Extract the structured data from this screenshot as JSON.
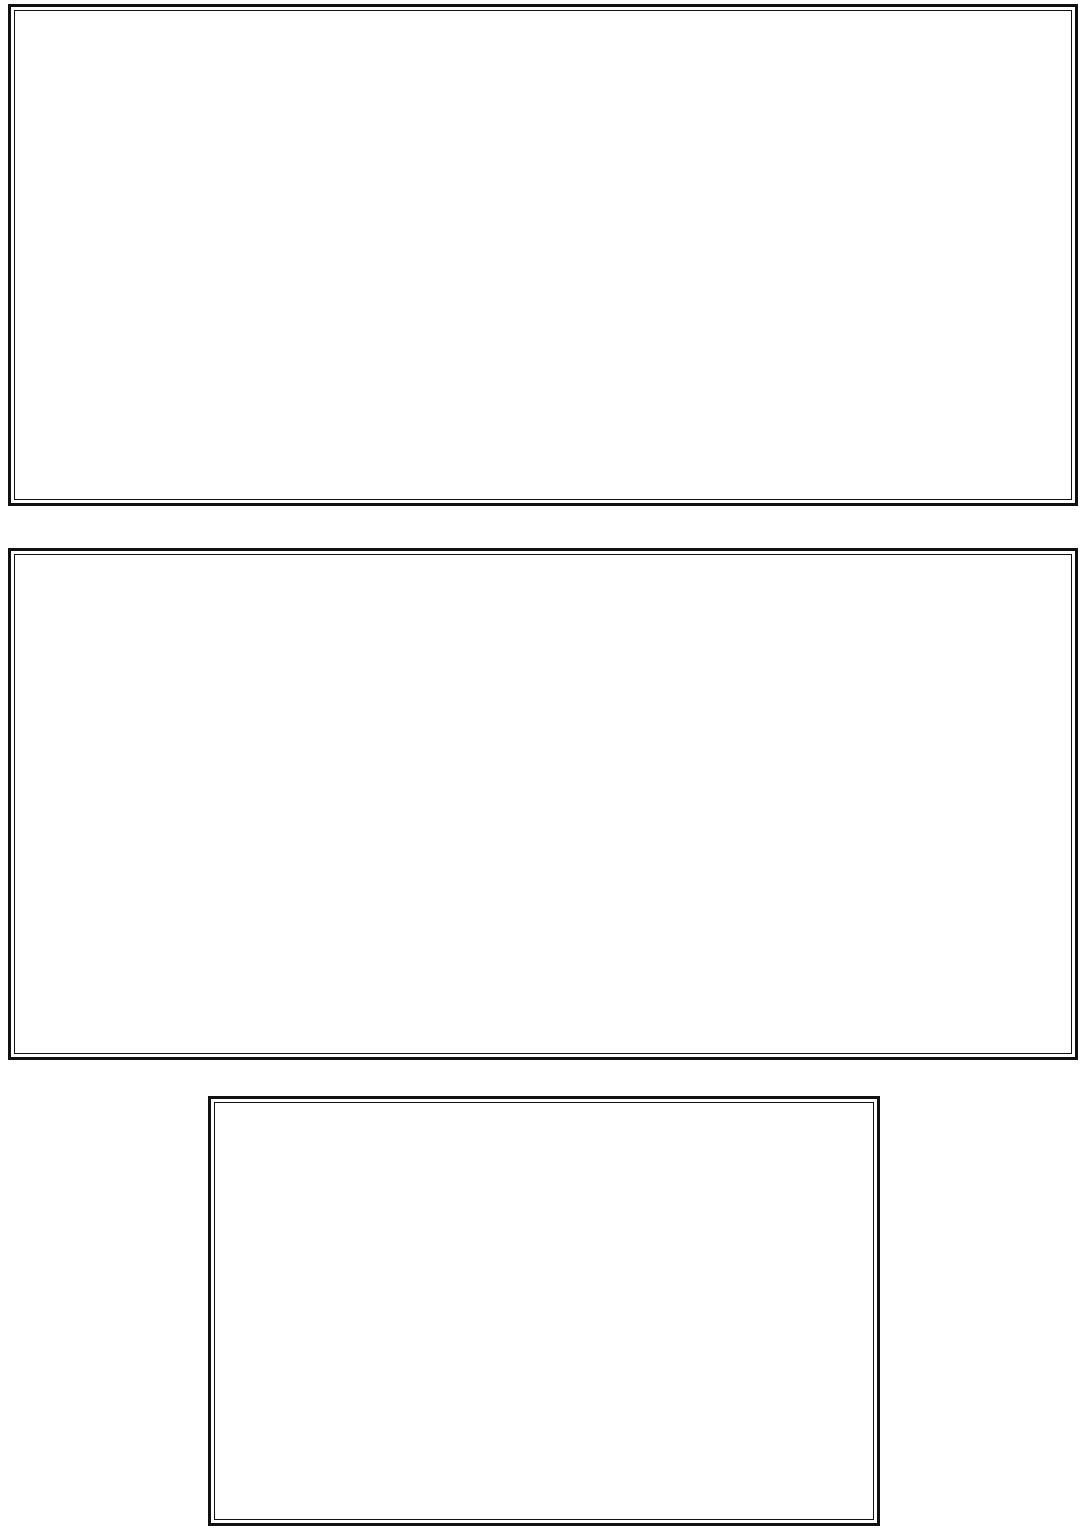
{
  "figure": {
    "series_names": [
      "OKABA",
      "ENUGU"
    ],
    "xlabel": "WEEKS",
    "colors": {
      "okaba_light": "#9db9e0",
      "okaba_light_edge": "#6f90c4",
      "enugu_light": "#f7b49c",
      "enugu_light_edge": "#e2764f",
      "okaba_dark": "#3e4b8f",
      "okaba_dark_edge": "#2c3770",
      "enugu_dark": "#8c4430",
      "enugu_dark_edge": "#6d3021",
      "axis": "#1a1a1a"
    }
  },
  "chart_data": [
    {
      "id": "volatile-matter",
      "type": "scatter",
      "title": "",
      "xlabel": "WEEKS",
      "ylabel": "VOLATILE MATTER  (%)",
      "xlim": [
        0,
        60
      ],
      "ylim": [
        35,
        45
      ],
      "xticks": [
        0,
        10,
        20,
        30,
        40,
        50,
        60
      ],
      "yticks": [
        35,
        37,
        39,
        41,
        43,
        45
      ],
      "xticklabels": [
        "0",
        "10",
        "20",
        "30",
        "40",
        "50",
        "60"
      ],
      "yticklabels": [
        "35",
        "37",
        "39",
        "41",
        "43",
        "45"
      ],
      "grid": true,
      "legend_position": "top-right",
      "palette": "light",
      "x": [
        0,
        1,
        4,
        10,
        19,
        32,
        52
      ],
      "series": [
        {
          "name": "OKABA",
          "marker": "diamond",
          "values": [
            43.0,
            40.7,
            39.0,
            37.5,
            36.3,
            35.4,
            35.15
          ]
        },
        {
          "name": "ENUGU",
          "marker": "square",
          "values": [
            44.0,
            43.0,
            42.5,
            41.9,
            41.6,
            41.4,
            41.0
          ]
        }
      ]
    },
    {
      "id": "oxygen",
      "type": "scatter",
      "title": "",
      "xlabel": "WEEKS",
      "ylabel": "OXYGEN (%)",
      "xlim": [
        0,
        60
      ],
      "ylim": [
        5,
        25
      ],
      "xticks": [
        0,
        10,
        20,
        30,
        40,
        50,
        60
      ],
      "yticks": [
        5,
        10,
        15,
        20,
        25
      ],
      "xticklabels": [
        "0",
        "10",
        "20",
        "30",
        "40",
        "50",
        "60"
      ],
      "yticklabels": [
        "5",
        "10",
        "15",
        "20",
        "25"
      ],
      "grid": true,
      "legend_position": "top-right",
      "palette": "dark",
      "x": [
        0,
        1,
        4,
        10,
        19,
        32,
        52
      ],
      "series": [
        {
          "name": "OKABA",
          "marker": "diamond",
          "values": [
            12.4,
            17.9,
            18.0,
            18.9,
            19.5,
            20.2,
            20.7
          ]
        },
        {
          "name": "ENUGU",
          "marker": "square",
          "values": [
            7.0,
            7.8,
            8.2,
            8.8,
            8.8,
            8.8,
            8.8
          ]
        }
      ]
    },
    {
      "id": "carbon",
      "type": "scatter",
      "title": "",
      "xlabel": "WEEKS",
      "ylabel": "CARBON (%)",
      "xlim": [
        0,
        60
      ],
      "ylim": [
        72,
        84
      ],
      "xticks": [
        0,
        10,
        20,
        30,
        40,
        50,
        60
      ],
      "yticks": [
        72,
        74,
        76,
        78,
        80,
        82,
        84
      ],
      "xticklabels": [
        "0",
        "10",
        "20",
        "30",
        "40",
        "50",
        "60"
      ],
      "yticklabels": [
        "72",
        "74",
        "76",
        "78",
        "80",
        "82",
        "84"
      ],
      "grid": true,
      "legend_position": "top-right",
      "palette": "dark",
      "x": [
        0,
        1,
        4,
        10,
        19,
        32,
        52
      ],
      "series": [
        {
          "name": "OKABA",
          "marker": "diamond",
          "values": [
            80.5,
            77.0,
            75.7,
            75.0,
            74.0,
            73.1,
            72.9
          ]
        },
        {
          "name": "ENUGU",
          "marker": "square",
          "values": [
            82.6,
            82.6,
            80.9,
            80.0,
            79.4,
            79.4,
            79.4
          ]
        }
      ]
    },
    {
      "id": "hydrogen",
      "type": "scatter",
      "title": "",
      "xlabel": "WEEKS",
      "ylabel": "HYDROGEN (%)",
      "xlim": [
        0,
        60
      ],
      "ylim": [
        5.3,
        6.0
      ],
      "xticks": [
        0,
        10,
        20,
        30,
        40,
        50,
        60
      ],
      "yticks": [
        5.3,
        5.4,
        5.5,
        5.6,
        5.7,
        5.8,
        5.9,
        6.0
      ],
      "xticklabels": [
        "0",
        "10",
        "20",
        "30",
        "40",
        "50",
        "60"
      ],
      "yticklabels": [
        "5.3",
        "5.4",
        "5.5",
        "5.6",
        "5.7",
        "5.8",
        "5.9",
        "6.0"
      ],
      "grid": true,
      "legend_position": "top-right",
      "palette": "dark",
      "x": [
        0,
        1,
        4,
        10,
        19,
        32,
        52
      ],
      "series": [
        {
          "name": "OKABA",
          "marker": "diamond",
          "values": [
            5.8,
            5.7,
            5.6,
            5.535,
            5.5,
            5.445,
            5.4
          ]
        },
        {
          "name": "ENUGU",
          "marker": "square",
          "values": [
            5.89,
            5.845,
            5.79,
            5.745,
            5.695,
            5.695,
            5.695
          ]
        }
      ]
    },
    {
      "id": "gross-calorific-value",
      "type": "scatter",
      "title": "",
      "xlabel": "WEEKS",
      "ylabel": "GROSS CALORIFIC VALUE  (MJ/kg)",
      "xlim": [
        0,
        60
      ],
      "ylim": [
        20,
        36
      ],
      "xticks": [
        0,
        10,
        20,
        30,
        40,
        50,
        60
      ],
      "yticks": [
        20,
        22,
        24,
        26,
        28,
        30,
        32,
        34,
        36
      ],
      "xticklabels": [
        "0",
        "10",
        "20",
        "30",
        "40",
        "50",
        "60"
      ],
      "yticklabels": [
        "20",
        "22",
        "24",
        "26",
        "28",
        "30",
        "32",
        "34",
        "36"
      ],
      "grid": true,
      "legend_position": "top-right",
      "palette": "dark",
      "x": [
        0,
        1,
        4,
        10,
        19,
        32,
        52
      ],
      "series": [
        {
          "name": "OKABA",
          "marker": "diamond",
          "values": [
            31.0,
            30.0,
            28.0,
            26.4,
            25.3,
            24.2,
            23.3
          ]
        },
        {
          "name": "ENUGU",
          "marker": "square",
          "values": [
            33.8,
            32.0,
            31.0,
            31.0,
            30.4,
            30.2,
            29.9
          ]
        }
      ]
    }
  ]
}
